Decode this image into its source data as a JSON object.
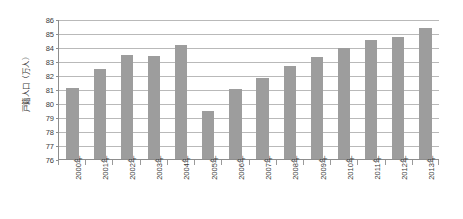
{
  "chart_data": {
    "type": "bar",
    "title": "",
    "xlabel": "",
    "ylabel": "戸籍人口（万人）",
    "ylim": [
      76,
      86
    ],
    "ytick_step": 1,
    "yticks": [
      86,
      85,
      84,
      83,
      82,
      81,
      80,
      79,
      78,
      77,
      76
    ],
    "grid": true,
    "legend": "none",
    "bar_color": "#9d9d9d",
    "gridline_color": "#b9b9b9",
    "axis_color": "#8d8d8d",
    "categories": [
      "2000年",
      "2001年",
      "2002年",
      "2003年",
      "2004年",
      "2005年",
      "2006年",
      "2007年",
      "2008年",
      "2009年",
      "2010年",
      "2011年",
      "2012年",
      "2013年"
    ],
    "values": [
      81.05,
      82.4,
      83.4,
      83.35,
      84.15,
      79.4,
      81.0,
      81.8,
      82.65,
      83.3,
      83.95,
      84.5,
      84.75,
      85.35
    ],
    "series": [
      {
        "name": "戸籍人口（万人）",
        "values": [
          81.05,
          82.4,
          83.4,
          83.35,
          84.15,
          79.4,
          81.0,
          81.8,
          82.65,
          83.3,
          83.95,
          84.5,
          84.75,
          85.35
        ]
      }
    ]
  }
}
